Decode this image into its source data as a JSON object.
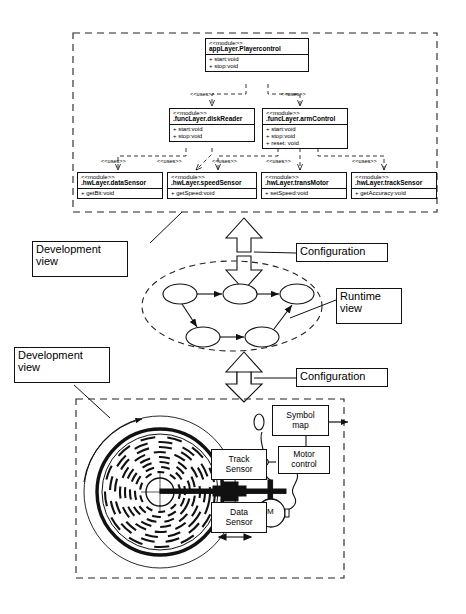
{
  "diagram": {
    "type": "uml-architecture-diagram"
  },
  "development_view_top": {
    "boundary_label": "Development view",
    "modules": [
      {
        "id": "playercontrol",
        "stereotype": "<<module>>",
        "name": "appLayer.Playercontrol",
        "operations": [
          "+ start:void",
          "+ stop:void"
        ]
      },
      {
        "id": "diskreader",
        "stereotype": "<<module>>",
        "name": ".funcLayer.diskReader",
        "operations": [
          "+ start:void",
          "+ stop:void"
        ]
      },
      {
        "id": "armcontrol",
        "stereotype": "<<module>>",
        "name": ".funcLayer.armControl",
        "operations": [
          "+ start:void",
          "+ stop:void",
          "+ reset: void"
        ]
      },
      {
        "id": "datasensor",
        "stereotype": "<<module>>",
        "name": ".hwLayer.dataSensor",
        "operations": [
          "+ getBit:void"
        ]
      },
      {
        "id": "speedsensor",
        "stereotype": "<<module>>",
        "name": ".hwLayer.speedSensor",
        "operations": [
          "+ getSpeed:void"
        ]
      },
      {
        "id": "transmotor",
        "stereotype": "<<module>>",
        "name": ".hwLayer.transMotor",
        "operations": [
          "+ setSpeed:void"
        ]
      },
      {
        "id": "tracksensor",
        "stereotype": "<<module>>",
        "name": ".hwLayer.trackSensor",
        "operations": [
          "+ getAccuracy:void"
        ]
      }
    ],
    "dependency_label": "<<uses>>",
    "dependencies": [
      {
        "from": "playercontrol",
        "to": "diskreader",
        "label": "<<uses>>"
      },
      {
        "from": "playercontrol",
        "to": "armcontrol",
        "label": "<<uses>>"
      },
      {
        "from": "diskreader",
        "to": "datasensor",
        "label": "<<uses>>"
      },
      {
        "from": "diskreader",
        "to": "speedsensor",
        "label": "<<uses>>"
      },
      {
        "from": "armcontrol",
        "to": "speedsensor",
        "label": "<<uses>>"
      },
      {
        "from": "armcontrol",
        "to": "transmotor",
        "label": "<<uses>>"
      },
      {
        "from": "armcontrol",
        "to": "tracksensor",
        "label": "<<uses>>"
      }
    ]
  },
  "runtime_view": {
    "boundary_label": "Runtime view",
    "node_count": 5,
    "edges": [
      {
        "from": "n1",
        "to": "n2"
      },
      {
        "from": "n2",
        "to": "n3"
      },
      {
        "from": "n1",
        "to": "n4"
      },
      {
        "from": "n4",
        "to": "n5"
      },
      {
        "from": "n5",
        "to": "n3"
      }
    ]
  },
  "development_view_bottom": {
    "boundary_label": "Development view",
    "components": [
      {
        "id": "track-sensor",
        "label": "Track\nSensor"
      },
      {
        "id": "data-sensor",
        "label": "Data\nSensor"
      },
      {
        "id": "symbol-map",
        "label": "Symbol\nmap"
      },
      {
        "id": "motor-control",
        "label": "Motor\ncontrol"
      },
      {
        "id": "motor",
        "label": "M"
      }
    ]
  },
  "transitions": [
    {
      "id": "config-top",
      "label": "Configuration"
    },
    {
      "id": "config-bottom",
      "label": "Configuration"
    }
  ],
  "colors": {
    "stroke": "#111111",
    "background": "#ffffff",
    "dash": "#333333"
  }
}
